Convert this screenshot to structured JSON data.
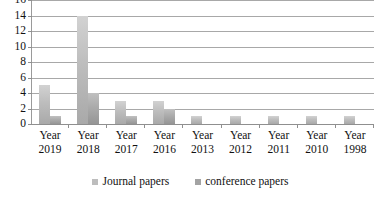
{
  "chart_data": {
    "type": "bar",
    "title": "",
    "subtitle": "",
    "xlabel": "",
    "ylabel": "",
    "ylim": [
      0,
      16
    ],
    "ytick_step": 2,
    "yticks": [
      16,
      14,
      12,
      10,
      8,
      6,
      4,
      2,
      0
    ],
    "grid": true,
    "grid_axis": "y",
    "legend_position": "bottom",
    "categories": [
      "Year 2019",
      "Year 2018",
      "Year 2017",
      "Year 2016",
      "Year 2013",
      "Year 2012",
      "Year 2011",
      "Year 2010",
      "Year 1998"
    ],
    "category_lines": [
      [
        "Year",
        "2019"
      ],
      [
        "Year",
        "2018"
      ],
      [
        "Year",
        "2017"
      ],
      [
        "Year",
        "2016"
      ],
      [
        "Year",
        "2013"
      ],
      [
        "Year",
        "2012"
      ],
      [
        "Year",
        "2011"
      ],
      [
        "Year",
        "2010"
      ],
      [
        "Year",
        "1998"
      ]
    ],
    "series": [
      {
        "name": "Journal papers",
        "color": "#bdbdbd",
        "values": [
          5,
          14,
          3,
          3,
          1,
          1,
          1,
          1,
          1
        ]
      },
      {
        "name": "conference papers",
        "color": "#a3a3a3",
        "values": [
          1,
          4,
          1,
          2,
          0,
          0,
          0,
          0,
          0
        ]
      }
    ]
  },
  "legend": {
    "items": [
      {
        "label": "Journal papers",
        "color": "#bdbdbd"
      },
      {
        "label": "conference papers",
        "color": "#a3a3a3"
      }
    ]
  },
  "colors": {
    "background": "#ffffff",
    "gridline": "#a8a8a8",
    "axis": "#8f8f8f",
    "text": "#111111",
    "series_journal": "#bdbdbd",
    "series_conference": "#a3a3a3"
  }
}
